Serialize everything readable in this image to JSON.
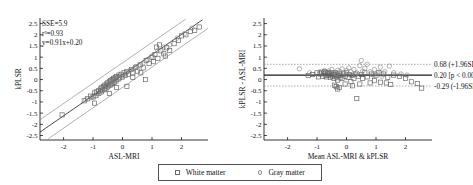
{
  "figure": {
    "legend": {
      "items": [
        {
          "label": "White matter",
          "marker": "square-marker-icon"
        },
        {
          "label": "Gray matter",
          "marker": "circle-marker-icon"
        }
      ]
    }
  },
  "chart_data": [
    {
      "type": "scatter",
      "id": "regression",
      "title": "",
      "xlabel": "ASL-MRI",
      "ylabel": "kPLSR",
      "xlim": [
        -2.8,
        2.9
      ],
      "ylim": [
        -2.7,
        2.75
      ],
      "xticks": [
        -2,
        -1,
        0,
        1,
        2
      ],
      "yticks": [
        2.5,
        2,
        1.5,
        1,
        0.5,
        0,
        -0.5,
        -1,
        -1.5,
        -2,
        -2.5
      ],
      "ytick_labels": [
        "2.5",
        "2",
        "1.5",
        "1",
        "0.5",
        "0",
        "-0.5",
        "-1",
        "-1.5",
        "-2",
        "-2.5"
      ],
      "xtick_labels": [
        "-2",
        "-1",
        "0",
        "1",
        "2"
      ],
      "grid": false,
      "annotations": [
        "SSE=5.9",
        "r²=0.93",
        "y=0.91x+0.20"
      ],
      "fit": {
        "slope": 0.91,
        "intercept": 0.2,
        "sse": 5.9,
        "r2": 0.93
      },
      "bands": {
        "offset": 0.55,
        "label": "confidence band"
      },
      "series": [
        {
          "name": "White matter",
          "marker": "square",
          "points": [
            [
              -2.05,
              -1.58
            ],
            [
              -1.3,
              -0.95
            ],
            [
              -1.18,
              -0.86
            ],
            [
              -1.08,
              -0.74
            ],
            [
              -1.0,
              -0.78
            ],
            [
              -0.95,
              -0.6
            ],
            [
              -0.9,
              -0.72
            ],
            [
              -0.88,
              -0.55
            ],
            [
              -0.82,
              -0.5
            ],
            [
              -0.8,
              -0.62
            ],
            [
              -0.75,
              -0.42
            ],
            [
              -0.72,
              -0.55
            ],
            [
              -0.7,
              -0.35
            ],
            [
              -0.68,
              -0.48
            ],
            [
              -0.65,
              -0.3
            ],
            [
              -0.62,
              -0.45
            ],
            [
              -0.6,
              -0.25
            ],
            [
              -0.58,
              -0.38
            ],
            [
              -0.55,
              -0.2
            ],
            [
              -0.52,
              -0.33
            ],
            [
              -0.5,
              -0.15
            ],
            [
              -0.48,
              -0.28
            ],
            [
              -0.45,
              -0.1
            ],
            [
              -0.42,
              -0.24
            ],
            [
              -0.4,
              -0.05
            ],
            [
              -0.38,
              -0.2
            ],
            [
              -0.35,
              0.0
            ],
            [
              -0.33,
              -0.16
            ],
            [
              -0.3,
              0.05
            ],
            [
              -0.28,
              -0.12
            ],
            [
              -0.25,
              0.1
            ],
            [
              -0.22,
              -0.06
            ],
            [
              -0.2,
              0.14
            ],
            [
              -0.15,
              0.02
            ],
            [
              -0.12,
              0.2
            ],
            [
              -0.1,
              0.08
            ],
            [
              -0.05,
              0.24
            ],
            [
              0.0,
              0.12
            ],
            [
              0.05,
              0.3
            ],
            [
              0.1,
              0.18
            ],
            [
              0.15,
              0.36
            ],
            [
              0.2,
              0.24
            ],
            [
              0.3,
              0.45
            ],
            [
              0.35,
              0.3
            ],
            [
              0.45,
              0.55
            ],
            [
              0.5,
              0.38
            ],
            [
              0.6,
              0.66
            ],
            [
              0.7,
              0.52
            ],
            [
              0.78,
              0.0
            ],
            [
              0.8,
              0.85
            ],
            [
              0.9,
              0.72
            ],
            [
              1.0,
              1.0
            ],
            [
              1.05,
              0.8
            ],
            [
              1.1,
              1.12
            ],
            [
              1.15,
              1.45
            ],
            [
              1.2,
              0.95
            ],
            [
              1.3,
              1.28
            ],
            [
              1.4,
              1.15
            ],
            [
              1.5,
              1.42
            ],
            [
              1.6,
              1.3
            ],
            [
              1.75,
              1.6
            ],
            [
              1.9,
              1.75
            ],
            [
              2.0,
              1.95
            ],
            [
              2.15,
              2.0
            ],
            [
              2.3,
              2.15
            ],
            [
              2.45,
              2.2
            ],
            [
              2.6,
              2.35
            ],
            [
              -0.95,
              -1.05
            ],
            [
              -0.45,
              -0.62
            ],
            [
              0.15,
              -0.3
            ],
            [
              -0.2,
              -0.35
            ],
            [
              0.35,
              0.1
            ],
            [
              0.62,
              0.3
            ],
            [
              1.25,
              1.55
            ],
            [
              1.45,
              1.05
            ]
          ]
        },
        {
          "name": "Gray matter",
          "marker": "circle",
          "points": [
            [
              -1.25,
              -0.9
            ],
            [
              -1.05,
              -0.8
            ],
            [
              -0.85,
              -0.65
            ],
            [
              -0.7,
              -0.5
            ],
            [
              -0.6,
              -0.4
            ],
            [
              -0.5,
              -0.3
            ],
            [
              -0.42,
              -0.18
            ],
            [
              -0.35,
              -0.12
            ],
            [
              -0.28,
              -0.05
            ],
            [
              -0.2,
              0.0
            ],
            [
              -0.12,
              0.06
            ],
            [
              -0.05,
              0.15
            ],
            [
              0.05,
              0.22
            ],
            [
              0.12,
              0.3
            ],
            [
              0.25,
              0.4
            ],
            [
              0.4,
              0.5
            ],
            [
              0.55,
              0.62
            ],
            [
              0.7,
              0.75
            ],
            [
              0.85,
              0.9
            ],
            [
              1.0,
              1.05
            ],
            [
              1.2,
              1.3
            ],
            [
              1.4,
              1.45
            ],
            [
              1.6,
              1.55
            ],
            [
              1.85,
              1.85
            ],
            [
              2.1,
              2.05
            ],
            [
              2.35,
              2.3
            ],
            [
              -0.55,
              -0.45
            ],
            [
              -0.38,
              -0.25
            ],
            [
              0.0,
              0.1
            ],
            [
              0.45,
              0.58
            ]
          ]
        }
      ]
    },
    {
      "type": "scatter",
      "id": "bland-altman",
      "title": "",
      "xlabel": "Mean ASL-MRI & kPLSR",
      "ylabel": "kPLSR - ASL-MRI",
      "xlim": [
        -2.8,
        2.9
      ],
      "ylim": [
        -2.7,
        2.75
      ],
      "xticks": [
        -2,
        -1,
        0,
        1,
        2
      ],
      "yticks": [
        2.5,
        2,
        1.5,
        1,
        0.5,
        0,
        -0.5,
        -1,
        -1.5,
        -2,
        -2.5
      ],
      "ytick_labels": [
        "2.5",
        "2",
        "1.5",
        "1",
        "0.5",
        "0",
        "-0.5",
        "-1",
        "-1.5",
        "-2",
        "-2.5"
      ],
      "xtick_labels": [
        "-2",
        "-1",
        "0",
        "1",
        "2"
      ],
      "grid": false,
      "reference_lines": [
        {
          "value": 0.68,
          "label": "0.68 (+1.96SD)",
          "style": "dotted"
        },
        {
          "value": 0.2,
          "label": "0.20 [p < 0.001]",
          "style": "solid"
        },
        {
          "value": -0.29,
          "label": "-0.29 (-1.96SD)",
          "style": "dotted"
        }
      ],
      "series": [
        {
          "name": "White matter",
          "marker": "square",
          "points": [
            [
              -1.3,
              0.18
            ],
            [
              -1.15,
              0.22
            ],
            [
              -1.0,
              0.3
            ],
            [
              -0.95,
              0.12
            ],
            [
              -0.9,
              0.25
            ],
            [
              -0.85,
              0.3
            ],
            [
              -0.8,
              0.15
            ],
            [
              -0.78,
              0.28
            ],
            [
              -0.75,
              0.35
            ],
            [
              -0.72,
              0.2
            ],
            [
              -0.7,
              0.3
            ],
            [
              -0.68,
              0.12
            ],
            [
              -0.65,
              0.25
            ],
            [
              -0.62,
              0.32
            ],
            [
              -0.6,
              0.18
            ],
            [
              -0.58,
              0.28
            ],
            [
              -0.55,
              0.1
            ],
            [
              -0.52,
              0.22
            ],
            [
              -0.5,
              0.3
            ],
            [
              -0.48,
              0.15
            ],
            [
              -0.45,
              0.25
            ],
            [
              -0.42,
              0.05
            ],
            [
              -0.4,
              0.2
            ],
            [
              -0.38,
              0.3
            ],
            [
              -0.35,
              0.12
            ],
            [
              -0.32,
              0.22
            ],
            [
              -0.3,
              -0.02
            ],
            [
              -0.28,
              0.18
            ],
            [
              -0.25,
              0.28
            ],
            [
              -0.22,
              0.08
            ],
            [
              -0.4,
              -0.25
            ],
            [
              -0.35,
              -0.32
            ],
            [
              -0.3,
              -0.42
            ],
            [
              -0.2,
              0.2
            ],
            [
              -0.15,
              0.05
            ],
            [
              -0.1,
              0.25
            ],
            [
              -0.05,
              0.15
            ],
            [
              0.0,
              0.3
            ],
            [
              0.05,
              0.1
            ],
            [
              0.1,
              0.22
            ],
            [
              0.15,
              -0.1
            ],
            [
              0.2,
              0.18
            ],
            [
              0.25,
              0.05
            ],
            [
              0.3,
              0.25
            ],
            [
              0.35,
              -0.85
            ],
            [
              0.4,
              0.15
            ],
            [
              0.5,
              0.22
            ],
            [
              0.55,
              0.05
            ],
            [
              0.62,
              0.3
            ],
            [
              0.7,
              0.12
            ],
            [
              0.85,
              0.25
            ],
            [
              0.95,
              -0.05
            ],
            [
              1.0,
              0.2
            ],
            [
              1.1,
              0.32
            ],
            [
              1.15,
              -0.12
            ],
            [
              1.25,
              0.25
            ],
            [
              1.4,
              0.1
            ],
            [
              1.5,
              -0.22
            ],
            [
              1.6,
              0.2
            ],
            [
              1.8,
              0.15
            ],
            [
              2.0,
              0.05
            ],
            [
              2.2,
              -0.1
            ],
            [
              2.4,
              -0.18
            ],
            [
              2.55,
              -0.38
            ],
            [
              -0.25,
              -0.35
            ],
            [
              0.45,
              -0.2
            ],
            [
              0.8,
              -0.15
            ],
            [
              1.35,
              -0.15
            ],
            [
              -0.05,
              -0.2
            ],
            [
              0.2,
              -0.28
            ]
          ]
        },
        {
          "name": "Gray matter",
          "marker": "circle",
          "points": [
            [
              -1.6,
              0.48
            ],
            [
              -1.25,
              0.3
            ],
            [
              -0.9,
              0.35
            ],
            [
              -0.75,
              0.4
            ],
            [
              -0.6,
              0.38
            ],
            [
              -0.5,
              0.45
            ],
            [
              -0.42,
              0.3
            ],
            [
              -0.3,
              0.42
            ],
            [
              -0.22,
              0.35
            ],
            [
              -0.15,
              0.48
            ],
            [
              -0.08,
              0.3
            ],
            [
              0.0,
              0.4
            ],
            [
              0.08,
              0.52
            ],
            [
              0.15,
              0.35
            ],
            [
              0.25,
              0.45
            ],
            [
              0.35,
              0.3
            ],
            [
              0.45,
              0.62
            ],
            [
              0.5,
              0.85
            ],
            [
              0.55,
              0.38
            ],
            [
              0.62,
              0.5
            ],
            [
              0.7,
              0.68
            ],
            [
              0.8,
              0.35
            ],
            [
              0.95,
              0.45
            ],
            [
              1.05,
              0.3
            ],
            [
              1.15,
              0.55
            ],
            [
              1.3,
              0.35
            ],
            [
              1.45,
              0.6
            ],
            [
              1.6,
              0.3
            ],
            [
              1.85,
              0.25
            ],
            [
              2.05,
              0.2
            ],
            [
              -0.35,
              0.25
            ],
            [
              0.3,
              0.22
            ],
            [
              0.9,
              0.2
            ],
            [
              1.2,
              0.15
            ]
          ]
        }
      ]
    }
  ]
}
